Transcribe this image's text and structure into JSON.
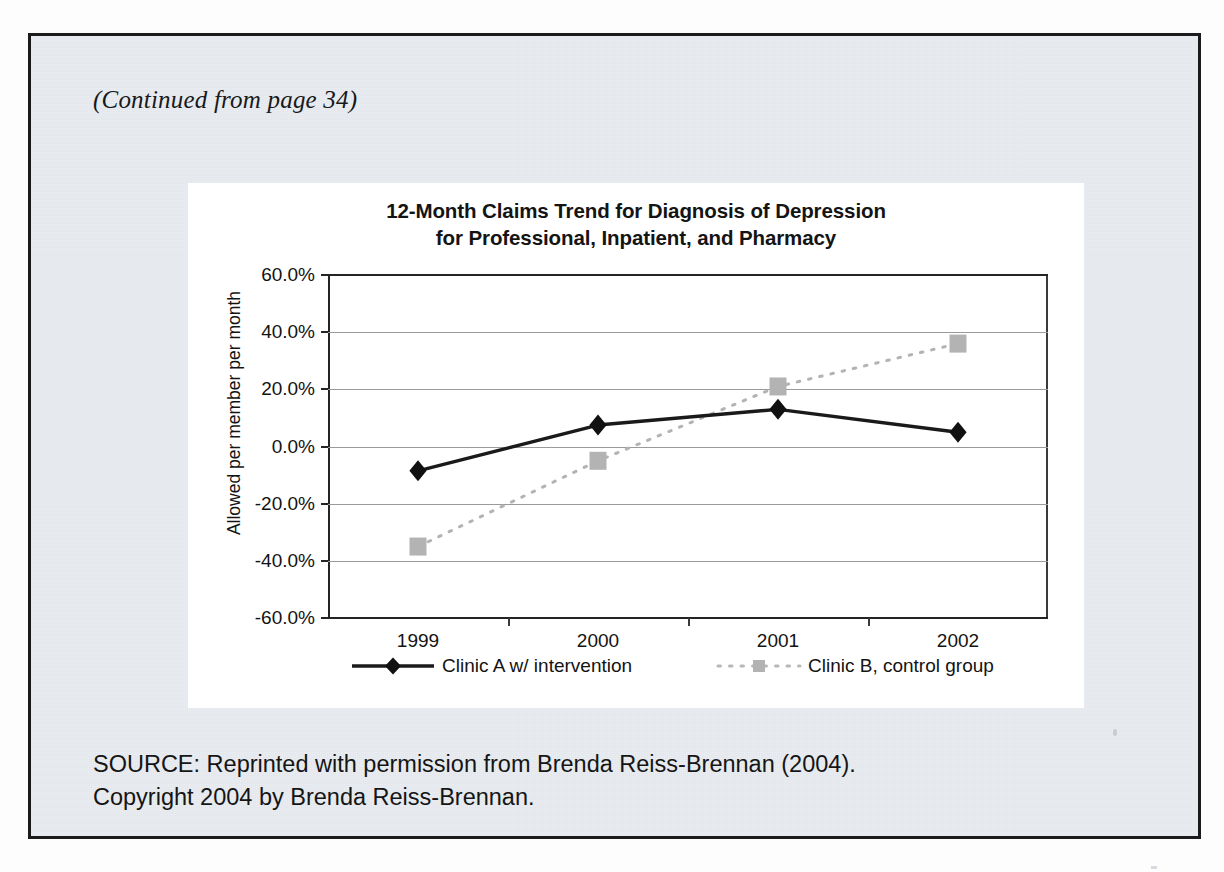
{
  "page": {
    "continued_note": "(Continued from page 34)",
    "source_lines": [
      "SOURCE:  Reprinted with permission from Brenda Reiss-Brennan (2004).",
      "Copyright 2004 by Brenda Reiss-Brennan."
    ]
  },
  "colors": {
    "frame": "#1b1b1b",
    "page_bg": "#e9edf1",
    "panel_bg": "#ffffff",
    "series_a": "#1a1a1a",
    "series_b": "#b3b3b3",
    "gridline": "#9a9a9a",
    "text": "#141414"
  },
  "chart_data": {
    "type": "line",
    "title": "12-Month Claims Trend for Diagnosis of Depression for Professional, Inpatient, and Pharmacy",
    "title_lines": [
      "12-Month Claims Trend for Diagnosis of Depression",
      "for Professional, Inpatient, and Pharmacy"
    ],
    "xlabel": "",
    "ylabel": "Allowed per member per month",
    "categories": [
      "1999",
      "2000",
      "2001",
      "2002"
    ],
    "x_tick_labels": [
      "1999",
      "2000",
      "2001",
      "2002"
    ],
    "y_tick_labels": [
      "60.0%",
      "40.0%",
      "20.0%",
      "0.0%",
      "-20.0%",
      "-40.0%",
      "-60.0%"
    ],
    "y_tick_values": [
      60.0,
      40.0,
      20.0,
      0.0,
      -20.0,
      -40.0,
      -60.0
    ],
    "ylim": [
      -60.0,
      60.0
    ],
    "y_unit": "%",
    "grid": true,
    "grid_axis": "y",
    "legend_position": "bottom",
    "series": [
      {
        "name": "Clinic A w/ intervention",
        "marker": "diamond",
        "line_style": "solid",
        "color": "#1a1a1a",
        "values": [
          -8.5,
          7.5,
          13.0,
          5.0
        ]
      },
      {
        "name": "Clinic B, control group",
        "marker": "square",
        "line_style": "dotted",
        "color": "#b3b3b3",
        "values": [
          -35.0,
          -5.0,
          21.0,
          36.0
        ]
      }
    ]
  }
}
